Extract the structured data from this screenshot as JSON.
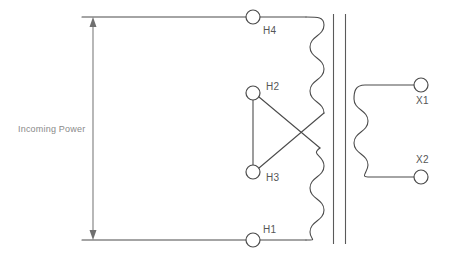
{
  "diagram": {
    "background_color": "#ffffff",
    "line_color": "#4b4b4b",
    "label_color": "#565656",
    "annotation_color": "#8a8a8a",
    "width": 449,
    "height": 259
  },
  "annotation": {
    "incoming_power_label": "Incoming Power"
  },
  "primary": {
    "name": "primary-winding",
    "terminals": [
      {
        "id": "H4",
        "label": "H4",
        "cx": 253,
        "cy": 17,
        "r": 7,
        "label_x": 263,
        "label_y": 34
      },
      {
        "id": "H2",
        "label": "H2",
        "cx": 253,
        "cy": 93,
        "r": 7,
        "label_x": 266,
        "label_y": 90
      },
      {
        "id": "H3",
        "label": "H3",
        "cx": 253,
        "cy": 172,
        "r": 7,
        "label_x": 266,
        "label_y": 181
      },
      {
        "id": "H1",
        "label": "H1",
        "cx": 253,
        "cy": 240,
        "r": 7,
        "label_x": 263,
        "label_y": 233
      }
    ],
    "coil_bumps_upper": 4,
    "coil_bumps_lower": 4
  },
  "secondary": {
    "name": "secondary-winding",
    "terminals": [
      {
        "id": "X1",
        "label": "X1",
        "cx": 421,
        "cy": 85,
        "r": 7,
        "label_x": 416,
        "label_y": 104
      },
      {
        "id": "X2",
        "label": "X2",
        "cx": 421,
        "cy": 177,
        "r": 7,
        "label_x": 416,
        "label_y": 163
      }
    ],
    "coil_bumps": 4
  },
  "core": {
    "name": "transformer-core",
    "left_line_x": 333,
    "right_line_x": 345,
    "top_y": 14,
    "bottom_y": 244
  }
}
